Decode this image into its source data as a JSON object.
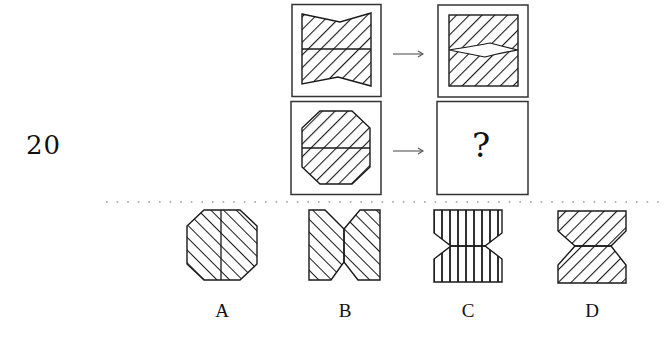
{
  "question": {
    "number": "20",
    "prompt_rows": [
      {
        "left_figure": "hourglass-notched-square-forward-hatch-horizontal-divider",
        "arrow": "→",
        "right_figure": "square-forward-hatch-lens-gap"
      },
      {
        "left_figure": "octagon-forward-hatch-horizontal-divider",
        "arrow": "→",
        "right_figure": "unknown"
      }
    ],
    "unknown_symbol": "?"
  },
  "options": [
    {
      "label": "A",
      "figure": "octagon-backslash-hatch-vertical-divider"
    },
    {
      "label": "B",
      "figure": "split-notched-rectangles-backslash-hatch"
    },
    {
      "label": "C",
      "figure": "hourglass-vertical-hatch"
    },
    {
      "label": "D",
      "figure": "hourglass-forward-hatch"
    }
  ],
  "colors": {
    "stroke": "#1a1a1a",
    "hatch": "#1a1a1a",
    "frame": "#333333",
    "arrow": "#555555",
    "divider_dots": "#9a9a9a"
  }
}
